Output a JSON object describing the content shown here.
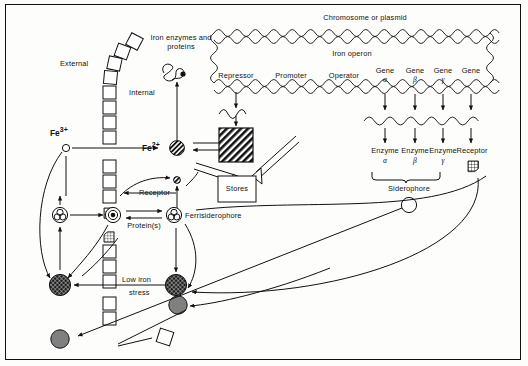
{
  "diagram": {
    "compartments": {
      "external_label": "External",
      "internal_label": "Internal"
    },
    "labels": {
      "iron_enzymes": "Iron enzymes and proteins",
      "chromosome": "Chromosome or plasmid",
      "iron_operon": "Iron operon",
      "repressor": "Repressor",
      "promoter": "Promoter",
      "operator": "Operator",
      "stores": "Stores",
      "receptor_membrane": "Receptor",
      "ferrisiderophore": "Ferrisiderophore",
      "proteins": "Protein(s)",
      "low_iron_stress_line1": "Low iron",
      "low_iron_stress_line2": "stress",
      "siderophore": "Siderophore",
      "receptor_product": "Receptor"
    },
    "ions": {
      "ferric": {
        "symbol": "Fe",
        "charge": "3+"
      },
      "ferrous": {
        "symbol": "Fe",
        "charge": "2+"
      }
    },
    "genes": [
      {
        "name": "Gene",
        "subscript": "α"
      },
      {
        "name": "Gene",
        "subscript": "β"
      },
      {
        "name": "Gene",
        "subscript": "γ"
      },
      {
        "name": "Gene",
        "subscript": ""
      }
    ],
    "products": [
      {
        "name": "Enzyme",
        "subscript": "α"
      },
      {
        "name": "Enzyme",
        "subscript": "β"
      },
      {
        "name": "Enzyme",
        "subscript": "γ"
      },
      {
        "name": "Receptor",
        "subscript": ""
      }
    ],
    "colors": {
      "ink": "#111111",
      "background": "#fdfdfc",
      "gray_particle": "#808080",
      "dark_particle": "#2b2b2b"
    }
  }
}
